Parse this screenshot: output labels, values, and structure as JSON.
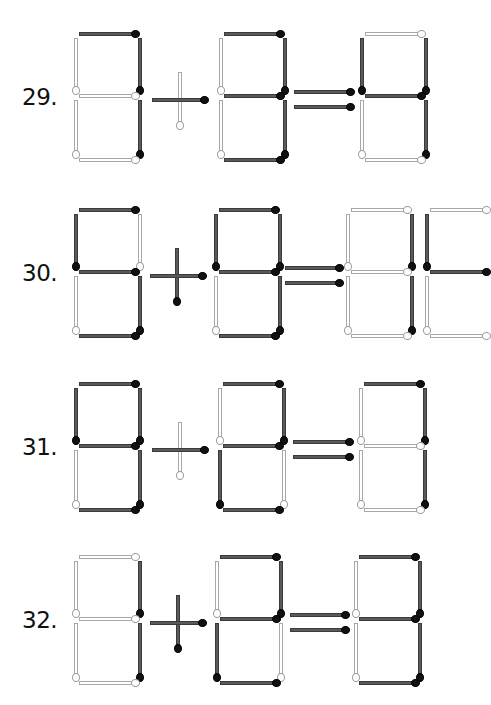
{
  "header": {
    "text": "· · · · · · ·"
  },
  "colors": {
    "dark_stick": "#5a5a5a",
    "dark_head": "#111111",
    "light_stick": "#ffffff",
    "light_outline": "#a8a8a8",
    "label": "#111111",
    "background": "#ffffff"
  },
  "segment_order": [
    "top",
    "top_left",
    "top_right",
    "middle",
    "bottom_left",
    "bottom_right",
    "bottom"
  ],
  "puzzles": [
    {
      "number": "29.",
      "top": 34,
      "equation_shown": "7 + 3 = 4",
      "digits": [
        {
          "x": 76,
          "value": "7",
          "dark": [
            "top",
            "top_right",
            "bottom_right"
          ],
          "light": [
            "top_left",
            "middle",
            "bottom_left",
            "bottom"
          ]
        },
        {
          "x": 221,
          "value": "3",
          "dark": [
            "top",
            "top_right",
            "middle",
            "bottom_right",
            "bottom"
          ],
          "light": [
            "top_left",
            "bottom_left"
          ]
        }
      ],
      "plus": {
        "horizontal": "dark",
        "vertical": "light"
      },
      "equals": {
        "upper": "dark",
        "lower": "dark"
      },
      "result_digits": [
        {
          "x": 362,
          "value": "4",
          "dark": [
            "top_left",
            "top_right",
            "middle",
            "bottom_right"
          ],
          "light": [
            "top",
            "bottom_left",
            "bottom"
          ]
        }
      ]
    },
    {
      "number": "30.",
      "top": 210,
      "equation_shown": "5 + 9 = 1?",
      "digits": [
        {
          "x": 76,
          "value": "5",
          "dark": [
            "top",
            "top_left",
            "middle",
            "bottom_right",
            "bottom"
          ],
          "light": [
            "top_right",
            "bottom_left"
          ]
        },
        {
          "x": 216,
          "value": "9",
          "dark": [
            "top",
            "top_left",
            "top_right",
            "middle",
            "bottom_right",
            "bottom"
          ],
          "light": [
            "bottom_left"
          ]
        }
      ],
      "plus": {
        "horizontal": "dark",
        "vertical": "dark"
      },
      "equals": {
        "upper": "dark",
        "lower": "dark"
      },
      "result_digits": [
        {
          "x": 348,
          "value": "1",
          "dark": [
            "top_right",
            "bottom_right"
          ],
          "light": [
            "top",
            "top_left",
            "middle",
            "bottom_left",
            "bottom"
          ]
        },
        {
          "x": 427,
          "value": "?",
          "dark": [
            "top_left",
            "middle"
          ],
          "light": [
            "top",
            "bottom_left",
            "bottom"
          ],
          "cut_off": true
        }
      ]
    },
    {
      "number": "31.",
      "top": 384,
      "equation_shown": "9 + 2 = 7",
      "digits": [
        {
          "x": 76,
          "value": "9",
          "dark": [
            "top",
            "top_left",
            "top_right",
            "middle",
            "bottom_right",
            "bottom"
          ],
          "light": [
            "bottom_left"
          ]
        },
        {
          "x": 220,
          "value": "2",
          "dark": [
            "top",
            "top_right",
            "middle",
            "bottom_left",
            "bottom"
          ],
          "light": [
            "top_left",
            "bottom_right"
          ]
        }
      ],
      "plus": {
        "horizontal": "dark",
        "vertical": "light"
      },
      "equals": {
        "upper": "dark",
        "lower": "dark"
      },
      "result_digits": [
        {
          "x": 361,
          "value": "7",
          "dark": [
            "top",
            "top_right",
            "bottom_right"
          ],
          "light": [
            "top_left",
            "middle",
            "bottom_left",
            "bottom"
          ]
        }
      ]
    },
    {
      "number": "32.",
      "top": 557,
      "equation_shown": "1 + 2 = 3",
      "digits": [
        {
          "x": 76,
          "value": "1",
          "dark": [
            "top_right",
            "bottom_right"
          ],
          "light": [
            "top",
            "top_left",
            "middle",
            "bottom_left",
            "bottom"
          ]
        },
        {
          "x": 217,
          "value": "2",
          "dark": [
            "top",
            "top_right",
            "middle",
            "bottom_left",
            "bottom"
          ],
          "light": [
            "top_left",
            "bottom_right"
          ]
        }
      ],
      "plus": {
        "horizontal": "dark",
        "vertical": "dark"
      },
      "equals": {
        "upper": "dark",
        "lower": "dark"
      },
      "result_digits": [
        {
          "x": 356,
          "value": "3",
          "dark": [
            "top",
            "top_right",
            "middle",
            "bottom_right",
            "bottom"
          ],
          "light": [
            "top_left",
            "bottom_left"
          ]
        }
      ]
    }
  ]
}
